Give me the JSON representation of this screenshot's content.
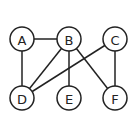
{
  "graph": {
    "nodes": [
      {
        "id": "A",
        "label": "A",
        "x": 22,
        "y": 39
      },
      {
        "id": "B",
        "label": "B",
        "x": 69,
        "y": 39
      },
      {
        "id": "C",
        "label": "C",
        "x": 115,
        "y": 39
      },
      {
        "id": "D",
        "label": "D",
        "x": 22,
        "y": 98
      },
      {
        "id": "E",
        "label": "E",
        "x": 69,
        "y": 98
      },
      {
        "id": "F",
        "label": "F",
        "x": 115,
        "y": 98
      }
    ],
    "edges": [
      [
        "A",
        "B"
      ],
      [
        "A",
        "D"
      ],
      [
        "B",
        "D"
      ],
      [
        "B",
        "E"
      ],
      [
        "B",
        "F"
      ],
      [
        "C",
        "D"
      ],
      [
        "C",
        "F"
      ]
    ],
    "node_radius": 12
  }
}
